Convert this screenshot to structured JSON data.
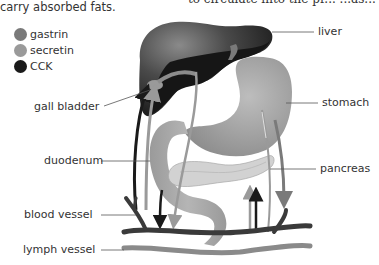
{
  "intro": {
    "text": "carry absorbed fats.",
    "clipped_text": "to circulate into the pr... ...as..."
  },
  "legend": {
    "items": [
      {
        "label": "gastrin",
        "color": "#7a7a7a"
      },
      {
        "label": "secretin",
        "color": "#9a9a9a"
      },
      {
        "label": "CCK",
        "color": "#1a1a1a"
      }
    ]
  },
  "labels": {
    "liver": "liver",
    "stomach": "stomach",
    "gall_bladder": "gall bladder",
    "duodenum": "duodenum",
    "pancreas": "pancreas",
    "blood_vessel": "blood vessel",
    "lymph_vessel": "lymph vessel"
  },
  "colors": {
    "liver_light": "#6e6e6e",
    "liver_dark": "#1c1c1c",
    "stomach": "#a8a8a8",
    "pancreas": "#cfcfcf",
    "blood_vessel": "#3a3a3a",
    "lymph_vessel": "#8a8a8a"
  }
}
